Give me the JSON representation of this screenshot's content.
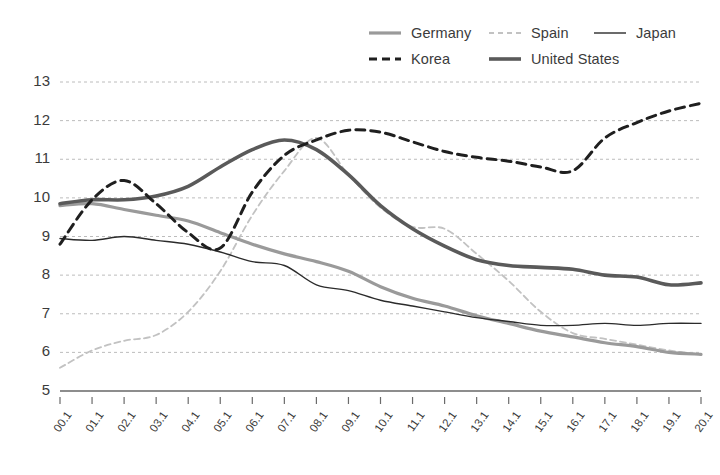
{
  "legend": {
    "position": "top-right",
    "items": [
      {
        "label": "Germany",
        "style": "solid",
        "color": "#9a9a9a",
        "width": 3.2,
        "icon": "line-swatch-solid"
      },
      {
        "label": "Spain",
        "style": "dashed",
        "color": "#c2c2c2",
        "width": 1.8,
        "icon": "line-swatch-dashed"
      },
      {
        "label": "Japan",
        "style": "solid",
        "color": "#2b2b2b",
        "width": 1.4,
        "icon": "line-swatch-solid"
      },
      {
        "label": "Korea",
        "style": "dashed",
        "color": "#1f1f1f",
        "width": 3.0,
        "icon": "line-swatch-dashed"
      },
      {
        "label": "United States",
        "style": "solid",
        "color": "#5a5a5a",
        "width": 3.6,
        "icon": "line-swatch-solid"
      }
    ]
  },
  "axis": {
    "y_ticks": [
      "13",
      "12",
      "11",
      "10",
      "9",
      "8",
      "7",
      "6",
      "5"
    ],
    "x_ticks": [
      "00.1",
      "01.1",
      "02.1",
      "03.1",
      "04.1",
      "05.1",
      "06.1",
      "07.1",
      "08.1",
      "09.1",
      "10.1",
      "11.1",
      "12.1",
      "13.1",
      "14.1",
      "15.1",
      "16.1",
      "17.1",
      "18.1",
      "19.1",
      "20.1"
    ]
  },
  "chart_data": {
    "type": "line",
    "title": "",
    "xlabel": "",
    "ylabel": "",
    "ylim": [
      5,
      13
    ],
    "xlim": [
      0,
      20
    ],
    "grid": true,
    "legend_position": "top-right",
    "x": [
      "00.1",
      "01.1",
      "02.1",
      "03.1",
      "04.1",
      "05.1",
      "06.1",
      "07.1",
      "08.1",
      "09.1",
      "10.1",
      "11.1",
      "12.1",
      "13.1",
      "14.1",
      "15.1",
      "16.1",
      "17.1",
      "18.1",
      "19.1",
      "20.1"
    ],
    "series": [
      {
        "name": "Germany",
        "color": "#9a9a9a",
        "style": "solid",
        "values": [
          9.8,
          9.85,
          9.7,
          9.55,
          9.4,
          9.1,
          8.8,
          8.55,
          8.35,
          8.1,
          7.7,
          7.4,
          7.2,
          6.95,
          6.75,
          6.55,
          6.4,
          6.25,
          6.15,
          6.0,
          5.95
        ]
      },
      {
        "name": "Spain",
        "color": "#c2c2c2",
        "style": "dashed",
        "values": [
          5.6,
          6.05,
          6.3,
          6.45,
          7.05,
          8.1,
          9.55,
          10.7,
          11.55,
          10.6,
          9.75,
          9.25,
          9.2,
          8.55,
          7.85,
          7.05,
          6.5,
          6.35,
          6.2,
          6.05,
          5.95
        ]
      },
      {
        "name": "Japan",
        "color": "#2b2b2b",
        "style": "solid",
        "values": [
          8.95,
          8.9,
          9.0,
          8.9,
          8.8,
          8.6,
          8.35,
          8.25,
          7.75,
          7.6,
          7.35,
          7.2,
          7.05,
          6.9,
          6.8,
          6.7,
          6.7,
          6.75,
          6.7,
          6.75,
          6.75
        ]
      },
      {
        "name": "Korea",
        "color": "#1f1f1f",
        "style": "dashed",
        "values": [
          8.8,
          9.95,
          10.45,
          9.85,
          9.1,
          8.7,
          10.15,
          11.1,
          11.5,
          11.75,
          11.7,
          11.45,
          11.2,
          11.05,
          10.95,
          10.8,
          10.7,
          11.55,
          11.95,
          12.25,
          12.45
        ]
      },
      {
        "name": "United States",
        "color": "#5a5a5a",
        "style": "solid",
        "values": [
          9.85,
          9.95,
          9.95,
          10.05,
          10.3,
          10.8,
          11.25,
          11.5,
          11.25,
          10.6,
          9.8,
          9.2,
          8.75,
          8.4,
          8.25,
          8.2,
          8.15,
          8.0,
          7.95,
          7.75,
          7.8
        ]
      }
    ]
  }
}
